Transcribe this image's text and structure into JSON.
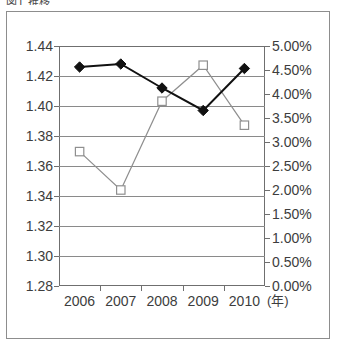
{
  "clipped_caption": "図1 推移",
  "chart_data": {
    "type": "line",
    "title": "",
    "xlabel": "(年)",
    "categories": [
      "2006",
      "2007",
      "2008",
      "2009",
      "2010"
    ],
    "grid": true,
    "legend": "none",
    "axes": {
      "left": {
        "label": "",
        "ylim": [
          1.28,
          1.44
        ],
        "tick_step": 0.02,
        "ticks": [
          "1.28",
          "1.30",
          "1.32",
          "1.34",
          "1.36",
          "1.38",
          "1.40",
          "1.42",
          "1.44"
        ],
        "tick_values": [
          1.28,
          1.3,
          1.32,
          1.34,
          1.36,
          1.38,
          1.4,
          1.42,
          1.44
        ]
      },
      "right": {
        "label": "",
        "ylim": [
          0.0,
          5.0
        ],
        "tick_step": 0.5,
        "ticks": [
          "0.00%",
          "0.50%",
          "1.00%",
          "1.50%",
          "2.00%",
          "2.50%",
          "3.00%",
          "3.50%",
          "4.00%",
          "4.50%",
          "5.00%"
        ],
        "tick_values": [
          0.0,
          0.5,
          1.0,
          1.5,
          2.0,
          2.5,
          3.0,
          3.5,
          4.0,
          4.5,
          5.0
        ]
      }
    },
    "series": [
      {
        "name": "series-diamond",
        "marker": "filled-diamond",
        "axis": "left",
        "color": "#111111",
        "values": [
          1.426,
          1.428,
          1.412,
          1.397,
          1.425
        ]
      },
      {
        "name": "series-square",
        "marker": "open-square",
        "axis": "right",
        "color": "#8f8f8f",
        "values": [
          2.8,
          2.0,
          3.85,
          4.6,
          3.35
        ]
      }
    ]
  },
  "colors": {
    "frame": "#6f6f6f",
    "grid": "#8a8a8a",
    "outer_border": "#8d8d8d",
    "text": "#3d3d3d",
    "series_diamond": "#111111",
    "series_square": "#8f8f8f"
  }
}
